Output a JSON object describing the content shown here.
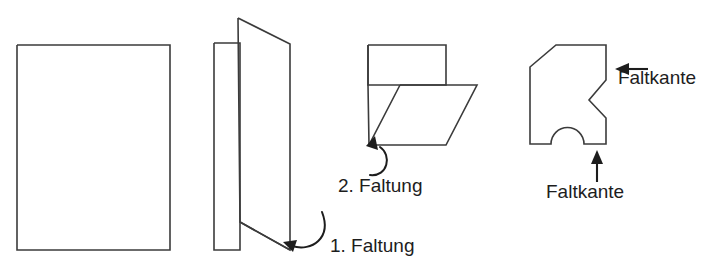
{
  "diagram": {
    "language": "de",
    "background_color": "#ffffff",
    "line_color": "#3b3b3b",
    "text_color": "#1d1d1d",
    "steps": [
      {
        "id": "step-1",
        "name": "flat-sheet",
        "label": ""
      },
      {
        "id": "step-2",
        "name": "first-fold",
        "label": "1. Faltung"
      },
      {
        "id": "step-3",
        "name": "second-fold",
        "label": "2. Faltung"
      },
      {
        "id": "step-4",
        "name": "cut-result",
        "label": "Faltkante"
      }
    ],
    "labels": {
      "fold_1": "1. Faltung",
      "fold_2": "2. Faltung",
      "fold_edge_right": "Faltkante",
      "fold_edge_bottom": "Faltkante"
    },
    "shapes": {
      "sheet_flat": {
        "name": "flat-sheet-rectangle",
        "points": "17,45 170,45 170,250 17,250 17,45"
      },
      "folded_back_panel": {
        "name": "folded-sheet-back-panel",
        "points": "214,43 240,43 240,250 214,250 214,43"
      },
      "folded_front_flap": {
        "name": "folded-sheet-front-flap",
        "points": "238,18 290,44 290,250 240,222 238,18"
      },
      "folded_fold_line": {
        "name": "folded-sheet-fold-crease",
        "points": "240,222 290,250"
      },
      "quarter_upper_rect": {
        "name": "quarter-fold-upper-rectangle",
        "points": "368,45 446,45 446,85 400,85 368,85 368,45"
      },
      "quarter_parallelogram": {
        "name": "quarter-fold-parallelogram",
        "points": "400,85 477,85 446,145 369,145 400,85"
      },
      "quarter_left_edge": {
        "name": "quarter-fold-left-edge",
        "points": "368,45 368,85 369,145"
      },
      "cut_result": {
        "name": "cut-result-outline",
        "path": "M 530,144 L 530,67 L 556,45 L 606,45 L 606,80 L 589,100 L 606,118 L 606,144 L 584,144 A 16.5 16.5 0 0 0 551,144 Z"
      }
    },
    "annotations": {
      "fold1_arrow": {
        "name": "fold-1-curved-arrow",
        "curve": "M 322,212 C 332,238 312,252 292,246",
        "head": "283,242 297,240 293,252"
      },
      "fold2_arrow": {
        "name": "fold-2-curved-arrow",
        "curve": "M 380,147 C 392,155 388,177 370,175",
        "head": "375,136 378,150 366,146"
      },
      "faltkante_right_arrow": {
        "name": "faltkante-right-arrow",
        "line": "M 648,69 L 623,69",
        "head": "615,69 629,63 629,75"
      },
      "faltkante_bottom_arrow": {
        "name": "faltkante-bottom-arrow",
        "line": "M 597,182 L 597,158",
        "head": "597,150 603,164 591,164"
      }
    },
    "text_positions": {
      "fold_1": {
        "x": 330,
        "y": 252
      },
      "fold_2": {
        "x": 338,
        "y": 192
      },
      "fold_edge_right": {
        "x": 657,
        "y": 84
      },
      "fold_edge_bottom": {
        "x": 546,
        "y": 198
      }
    }
  }
}
